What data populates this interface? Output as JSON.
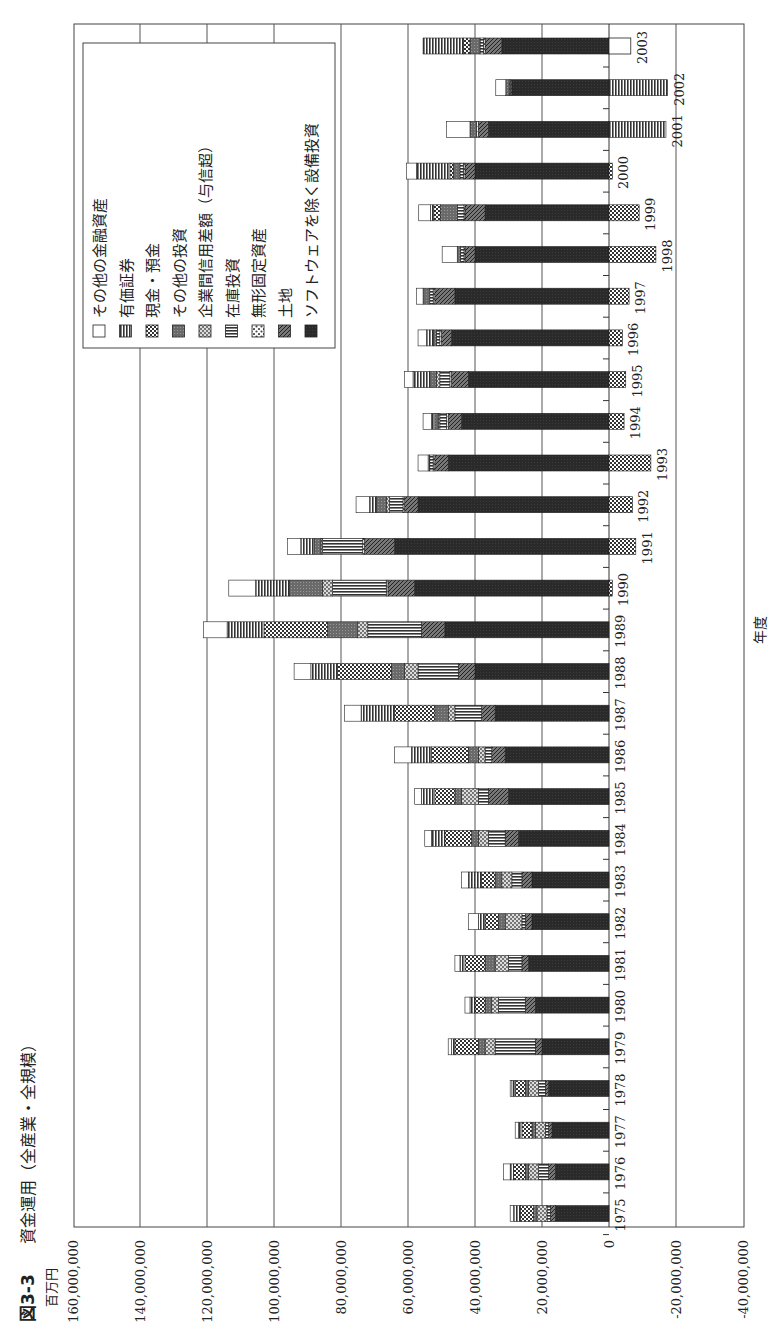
{
  "figure": {
    "number": "図3-3",
    "title": "資金運用（全産業・全規模）",
    "unit": "百万円",
    "x_axis_title": "年度"
  },
  "legend": [
    {
      "key": "other_financial",
      "label": "その他の金融資産",
      "pattern": "white"
    },
    {
      "key": "securities",
      "label": "有価証券",
      "pattern": "vlines"
    },
    {
      "key": "cash",
      "label": "現金・預金",
      "pattern": "checker"
    },
    {
      "key": "other_invest",
      "label": "その他の投資",
      "pattern": "grey"
    },
    {
      "key": "intercorp",
      "label": "企業間信用差額（与信超）",
      "pattern": "dots"
    },
    {
      "key": "inventory",
      "label": "在庫投資",
      "pattern": "hlines"
    },
    {
      "key": "intangible",
      "label": "無形固定資産",
      "pattern": "dots2"
    },
    {
      "key": "land",
      "label": "土地",
      "pattern": "diag"
    },
    {
      "key": "capex",
      "label": "ソフトウェアを除く設備投資",
      "pattern": "dark"
    }
  ],
  "colors": {
    "dark": "#2a2a2a",
    "grid": "#555555",
    "frame": "#444444"
  },
  "chart_data": {
    "type": "bar",
    "orientation": "rotated-90 (stacked horizontal bars, value axis reversed)",
    "xlabel": "年度",
    "ylabel": "百万円",
    "ylim": [
      -40000000,
      160000000
    ],
    "y_ticks": [
      "160,000,000",
      "140,000,000",
      "120,000,000",
      "100,000,000",
      "80,000,000",
      "60,000,000",
      "40,000,000",
      "20,000,000",
      "0",
      "-20,000,000",
      "-40,000,000"
    ],
    "grid": true,
    "legend_position": "upper-left inside plot",
    "categories": [
      "1975",
      "1976",
      "1977",
      "1978",
      "1979",
      "1980",
      "1981",
      "1982",
      "1983",
      "1984",
      "1985",
      "1986",
      "1987",
      "1988",
      "1989",
      "1990",
      "1991",
      "1992",
      "1993",
      "1994",
      "1995",
      "1996",
      "1997",
      "1998",
      "1999",
      "2000",
      "2001",
      "2002",
      "2003"
    ],
    "series": [
      {
        "name": "ソフトウェアを除く設備投資",
        "key": "capex",
        "values": [
          16,
          16,
          17,
          18,
          20,
          22,
          24,
          23,
          23,
          27,
          30,
          31,
          34,
          40,
          49,
          58,
          64,
          57,
          48,
          44,
          42,
          47,
          46,
          40,
          37,
          40,
          36,
          29,
          32
        ]
      },
      {
        "name": "土地",
        "key": "land",
        "values": [
          1.5,
          2,
          1,
          1,
          2,
          3,
          2,
          2,
          3,
          4,
          6,
          4,
          4,
          5,
          7,
          8,
          9,
          4,
          4,
          4,
          5,
          3,
          6,
          3,
          6,
          3,
          3,
          0.5,
          5
        ]
      },
      {
        "name": "無形固定資産",
        "key": "intangible",
        "values": [
          0,
          0,
          0,
          0,
          0,
          0,
          0,
          0,
          0,
          0,
          0,
          0,
          0,
          0,
          0,
          0.5,
          0.5,
          0.5,
          0.5,
          0.5,
          0.5,
          0.5,
          0.5,
          0.3,
          0.3,
          0.5,
          0.5,
          0.3,
          0.5
        ]
      },
      {
        "name": "在庫投資",
        "key": "inventory",
        "values": [
          1,
          3,
          1,
          2,
          12,
          8,
          4,
          1,
          3,
          5,
          3,
          2,
          8,
          12,
          16,
          16,
          12,
          4,
          1,
          2,
          3,
          1,
          1,
          1,
          2,
          1,
          0,
          0,
          1
        ]
      },
      {
        "name": "企業間信用差額（与信超）",
        "key": "intercorp",
        "values": [
          3,
          3,
          3,
          3,
          3,
          2,
          4,
          5,
          3,
          3,
          5,
          2,
          2,
          4,
          3,
          3,
          0.5,
          1,
          0,
          0.5,
          1,
          0,
          0,
          0,
          0,
          0,
          0,
          0,
          0
        ]
      },
      {
        "name": "その他の投資",
        "key": "other_invest",
        "values": [
          1,
          1,
          1,
          1,
          2,
          2,
          3,
          2,
          2,
          2,
          2,
          3,
          4,
          4,
          9,
          10,
          2,
          3,
          0,
          1,
          2,
          1,
          2,
          1,
          5,
          2,
          2,
          1,
          3
        ]
      },
      {
        "name": "現金・預金",
        "key": "cash",
        "values": [
          4,
          3.5,
          3,
          3,
          7,
          3,
          6,
          4,
          4,
          8,
          6,
          11,
          12,
          16,
          19,
          0,
          0,
          0,
          0,
          0,
          0,
          0,
          0,
          0,
          2,
          1,
          0,
          0,
          2
        ]
      },
      {
        "name": "有価証券",
        "key": "securities",
        "values": [
          2,
          1,
          1,
          1,
          1,
          1.5,
          1.5,
          2,
          4,
          4,
          4,
          6,
          10,
          8,
          11,
          10,
          4,
          2,
          0.5,
          1,
          5,
          2,
          0,
          0,
          1,
          10,
          0,
          0,
          12
        ]
      },
      {
        "name": "その他の金融資産",
        "key": "other_financial",
        "values": [
          1,
          2,
          1,
          0.5,
          1,
          1.5,
          1.5,
          3,
          2,
          2,
          2,
          5,
          5,
          5,
          7,
          8,
          4,
          4,
          3,
          2.5,
          2.5,
          2.5,
          2,
          4.5,
          3.5,
          3,
          7,
          3,
          -6.5
        ]
      },
      {
        "name": "負の項目（合計、0より右側）",
        "key": "negative_total",
        "values": [
          0,
          0,
          0,
          0,
          0,
          0,
          0,
          0,
          0,
          0,
          0,
          0,
          0,
          0,
          0,
          -1,
          -8,
          -7,
          -12.5,
          -4.5,
          -5,
          -4,
          -6,
          -14,
          -9,
          -1,
          -17,
          -17.5,
          -6.5
        ]
      }
    ],
    "unit_note": "values in units of 1,000,000 百万円 (i.e. axis value / 1e6)"
  }
}
